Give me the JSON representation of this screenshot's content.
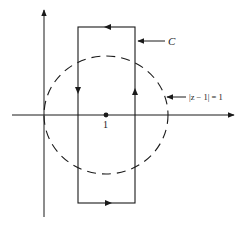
{
  "diagram": {
    "type": "complex-plane contour",
    "point_label": "1",
    "contour_label": "C",
    "circle_label": "|z − 1| = 1",
    "colors": {
      "ink": "#1a1a1a",
      "background": "#ffffff"
    },
    "elements": {
      "real_axis": "horizontal axis with arrow pointing right",
      "imaginary_axis": "vertical axis with arrow pointing up",
      "circle": "dashed circle centered at 1 with radius 1",
      "contour": "rectangle C traversed counterclockwise (arrows: top leftward, left downward, bottom rightward, right upward)"
    }
  }
}
